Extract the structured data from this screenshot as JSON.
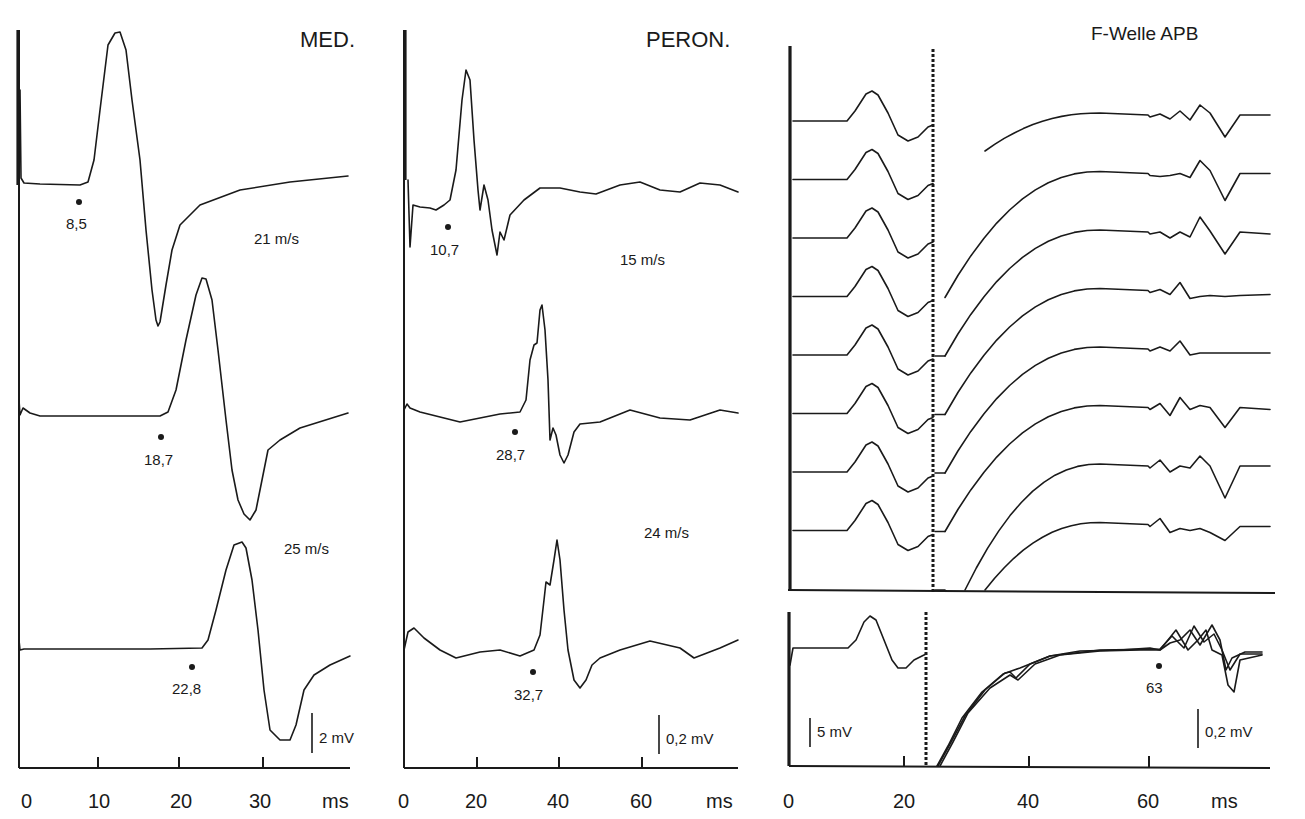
{
  "chart_data": [
    {
      "type": "line",
      "panel": "MED.",
      "title": "MED.",
      "xlabel": "ms",
      "x_ticks": [
        0,
        10,
        20,
        30
      ],
      "xlim": [
        0,
        40
      ],
      "scale_bar": "2 mV",
      "series": [
        {
          "name": "trace-1",
          "latency_label": "8,5",
          "latency_ms": 8.5,
          "peak_ms": 12.5,
          "trough_ms": 17.5
        },
        {
          "name": "trace-2",
          "latency_label": "18,7",
          "latency_ms": 18.7,
          "peak_ms": 22.5,
          "trough_ms": 28.5
        },
        {
          "name": "trace-3",
          "latency_label": "22,8",
          "latency_ms": 22.8,
          "peak_ms": 27.0,
          "trough_ms": 33.5
        }
      ],
      "annotations": [
        "21 m/s",
        "25 m/s"
      ]
    },
    {
      "type": "line",
      "panel": "PERON.",
      "title": "PERON.",
      "xlabel": "ms",
      "x_ticks": [
        0,
        20,
        40,
        60
      ],
      "xlim": [
        0,
        80
      ],
      "scale_bar": "0,2 mV",
      "series": [
        {
          "name": "trace-1",
          "latency_label": "10,7",
          "latency_ms": 10.7,
          "peak_ms": 16,
          "trough_ms": 25
        },
        {
          "name": "trace-2",
          "latency_label": "28,7",
          "latency_ms": 28.7,
          "peak_ms": 35,
          "trough_ms": 41
        },
        {
          "name": "trace-3",
          "latency_label": "32,7",
          "latency_ms": 32.7,
          "peak_ms": 39,
          "trough_ms": 45
        }
      ],
      "annotations": [
        "15 m/s",
        "24 m/s"
      ]
    },
    {
      "type": "line",
      "panel": "F-Welle APB",
      "title": "F-Welle APB",
      "xlabel": "ms",
      "x_ticks": [
        0,
        20,
        40,
        60
      ],
      "xlim": [
        0,
        75
      ],
      "scale_bars": [
        "5 mV",
        "0,2 mV"
      ],
      "gain_change_ms": 23.5,
      "stacked_traces": 8,
      "superimposed_latency_label": "63",
      "superimposed_latency_ms": 63,
      "m_wave_peak_ms": 14,
      "f_wave_region_ms": [
        63,
        72
      ]
    }
  ],
  "panels": {
    "med": {
      "title": "MED.",
      "velocity_1": "21 m/s",
      "velocity_2": "25 m/s",
      "lat_1": "8,5",
      "lat_2": "18,7",
      "lat_3": "22,8",
      "scale": "2 mV",
      "unit": "ms",
      "ticks": [
        "0",
        "10",
        "20",
        "30"
      ]
    },
    "peron": {
      "title": "PERON.",
      "velocity_1": "15 m/s",
      "velocity_2": "24 m/s",
      "lat_1": "10,7",
      "lat_2": "28,7",
      "lat_3": "32,7",
      "scale": "0,2 mV",
      "unit": "ms",
      "ticks": [
        "0",
        "20",
        "40",
        "60"
      ]
    },
    "fwave": {
      "title": "F-Welle APB",
      "lat": "63",
      "scale_left": "5 mV",
      "scale_right": "0,2 mV",
      "unit": "ms",
      "ticks": [
        "0",
        "20",
        "40",
        "60"
      ]
    }
  }
}
